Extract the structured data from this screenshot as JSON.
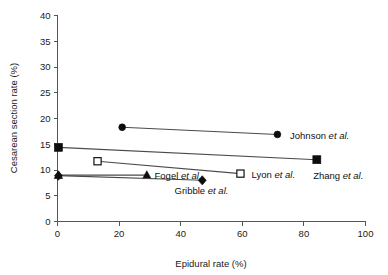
{
  "chart_data": {
    "type": "scatter",
    "title": "",
    "xlabel": "Epidural rate (%)",
    "ylabel": "Cesarean section rate (%)",
    "xlim": [
      0,
      100
    ],
    "ylim": [
      0,
      40
    ],
    "xticks": [
      0,
      20,
      40,
      60,
      80,
      100
    ],
    "yticks": [
      0,
      5,
      10,
      15,
      20,
      25,
      30,
      35,
      40
    ],
    "grid": false,
    "legend": "inline-point-labels",
    "series": [
      {
        "name": "Johnson et al.",
        "label_plain": "Johnson",
        "label_italic": "et al.",
        "marker": "filled-circle",
        "points": [
          {
            "x": 21.0,
            "y": 18.3
          },
          {
            "x": 71.4,
            "y": 16.9
          }
        ],
        "label_at": {
          "x": 75.5,
          "y": 16.6
        }
      },
      {
        "name": "Zhang et al.",
        "label_plain": "Zhang",
        "label_italic": "et al.",
        "marker": "filled-square",
        "points": [
          {
            "x": 0.3,
            "y": 14.4
          },
          {
            "x": 84.2,
            "y": 12.0
          }
        ],
        "label_at": {
          "x": 83.0,
          "y": 9.0
        }
      },
      {
        "name": "Lyon et al.",
        "label_plain": "Lyon",
        "label_italic": "et al.",
        "marker": "open-square",
        "points": [
          {
            "x": 13.0,
            "y": 11.7
          },
          {
            "x": 59.4,
            "y": 9.3
          }
        ],
        "label_at": {
          "x": 63.0,
          "y": 9.2
        }
      },
      {
        "name": "Fogel et al.",
        "label_plain": "Fogel",
        "label_italic": "et al.",
        "marker": "filled-triangle",
        "points": [
          {
            "x": 0.3,
            "y": 9.0
          },
          {
            "x": 29.0,
            "y": 9.0
          }
        ],
        "label_at": {
          "x": 31.5,
          "y": 9.0
        }
      },
      {
        "name": "Gribble et al.",
        "label_plain": "Gribble",
        "label_italic": "et al.",
        "marker": "filled-diamond",
        "points": [
          {
            "x": 0.3,
            "y": 8.9
          },
          {
            "x": 47.0,
            "y": 8.0
          }
        ],
        "label_at": {
          "x": 38.0,
          "y": 6.0
        }
      }
    ]
  }
}
